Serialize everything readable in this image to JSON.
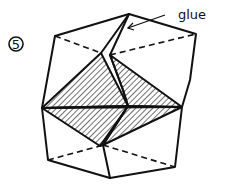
{
  "diagram": {
    "step_number": "5",
    "annotation_label": "glue",
    "colors": {
      "line": "#111111",
      "background": "#ffffff"
    }
  }
}
